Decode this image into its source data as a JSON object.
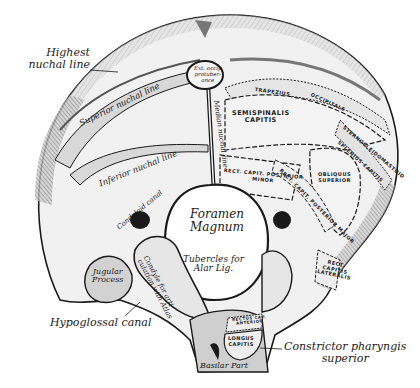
{
  "figure": {
    "colors": {
      "bone_fill": "#e9e9e9",
      "bone_shade": "#9a9a9a",
      "ink": "#1a1a1a",
      "muscle_area": "#efefef",
      "background": "#ffffff"
    }
  },
  "labels": {
    "external": {
      "highest_nuchal_line": [
        "Highest",
        "nuchal line"
      ],
      "hypoglossal_canal": "Hypoglossal canal",
      "constrictor_pharyngis_superior": [
        "Constrictor pharyngis",
        "superior"
      ]
    },
    "on_bone": {
      "ext_occip_protuberance": [
        "Ext. occip",
        "protuber-",
        "ance"
      ],
      "superior_nuchal_line": "Superior nuchal line",
      "inferior_nuchal_line": "Inferior nuchal line",
      "median_nuchal_line": "Median nuchal line",
      "condyloid_canal": "Condyloid canal",
      "foramen_magnum": [
        "Foramen",
        "Magnum"
      ],
      "tubercles_alar": [
        "Tubercles for",
        "Alar Lig."
      ],
      "jugular_process": [
        "Jugular",
        "Process"
      ],
      "condyle": [
        "Condyle for arti-",
        "culation with Atlas"
      ],
      "basilar_part": "Basilar Part"
    },
    "muscles": {
      "semispinalis_capitis": [
        "SEMISPINALIS",
        "CAPITIS"
      ],
      "trapezius": "TRAPEZIUS",
      "occipitale": "OCCIPITALE",
      "sternocleidomastoid": "STERNOCLEIDOMASTOID",
      "splenius_capitis": "SPLENIUS CAPITIS",
      "obliquus_superior": [
        "OBLIQUUS",
        "SUPERIOR"
      ],
      "rect_cap_post_minor": [
        "RECT. CAPIT. POSTERIOR",
        "MINOR"
      ],
      "rect_cap_post_major": "RECT. CAPIT. POSTERIOR MAJOR",
      "rect_cap_lateralis": [
        "RECT.",
        "CAPITIS",
        "LATERALIS"
      ],
      "rect_cap_anterior": [
        "RECTUS CAP.",
        "ANTERIOR"
      ],
      "longus_capitis": [
        "LONGUS",
        "CAPITIS"
      ]
    }
  }
}
